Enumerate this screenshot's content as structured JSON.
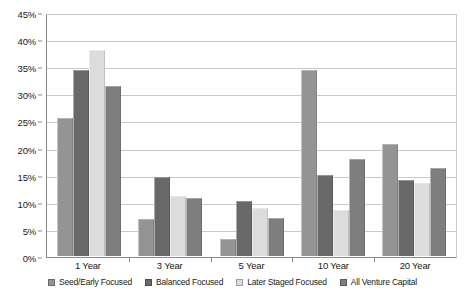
{
  "chart_data": {
    "type": "bar",
    "title": "",
    "subtitle": "",
    "xlabel": "",
    "ylabel": "",
    "categories": [
      "1 Year",
      "3 Year",
      "5 Year",
      "10 Year",
      "20 Year"
    ],
    "series": [
      {
        "name": "Seed/Early Focused",
        "color": "#949494",
        "values": [
          25.5,
          6.9,
          3.1,
          34.5,
          20.7
        ]
      },
      {
        "name": "Balanced Focused",
        "color": "#696969",
        "values": [
          34.5,
          14.6,
          10.1,
          15.0,
          14.1
        ]
      },
      {
        "name": "Later Staged Focused",
        "color": "#dcdcdc",
        "values": [
          38.2,
          11.2,
          8.9,
          8.5,
          13.6
        ]
      },
      {
        "name": "All Venture Capital",
        "color": "#7e7e7e",
        "values": [
          31.4,
          10.8,
          7.0,
          17.9,
          16.3
        ]
      }
    ],
    "ylim": [
      0,
      45
    ],
    "y_tick_step": 5,
    "y_tick_labels": [
      "0%",
      "5%",
      "10%",
      "15%",
      "20%",
      "25%",
      "30%",
      "35%",
      "40%",
      "45%"
    ],
    "y_tick_values": [
      0,
      5,
      10,
      15,
      20,
      25,
      30,
      35,
      40,
      45
    ],
    "grid": true,
    "grid_axis": "y",
    "legend_position": "bottom",
    "value_suffix": "%"
  }
}
